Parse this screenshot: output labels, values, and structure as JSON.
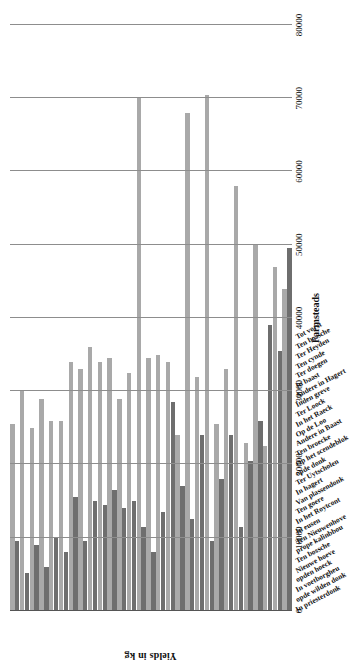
{
  "chart_data": {
    "type": "bar",
    "title": "",
    "xlabel": "Farmsteads",
    "ylabel": "Yields in kg",
    "orientation": "vertical-bars-rotated-page",
    "grid": true,
    "legend": "none",
    "ylim": [
      0,
      80000
    ],
    "yticks": [
      0,
      10000,
      20000,
      30000,
      40000,
      50000,
      60000,
      70000,
      80000
    ],
    "categories": [
      "In priesterdonk",
      "opde wilden donk",
      "In voetborgheu",
      "opden hoeck",
      "Nieuwe hoeve",
      "Ten bossche",
      "prope kalinbbou",
      "Ten Nieuwenhove",
      "In eusen",
      "In het Roytcont",
      "Ten goere",
      "Van plassendonk",
      "In hagert",
      "Ter Uytscholen",
      "opde donk",
      "Op het scendeblok",
      "Ten broecke",
      "Andere in Baast",
      "Op de Loo",
      "In het Raeck",
      "Ter Loock",
      "Inden greve",
      "Andere in Hagert",
      "In baast",
      "Ter doegen",
      "Ten cynde",
      "Ter Heyden",
      "Ten bossche",
      "Tot vorst"
    ],
    "series": [
      {
        "name": "Series 1",
        "color": "#a9a9a9",
        "values": [
          25500,
          30000,
          25000,
          29000,
          26000,
          26000,
          34000,
          33000,
          36000,
          34000,
          34500,
          29000,
          32500,
          70000,
          34500,
          35000,
          34000,
          24000,
          68000,
          32000,
          70500,
          25500,
          33000,
          58000,
          23000,
          50000,
          22500,
          47000,
          44000
        ]
      },
      {
        "name": "Series 2",
        "color": "#6e6e6e",
        "values": [
          9500,
          5200,
          9000,
          6000,
          10000,
          8000,
          15500,
          9500,
          15000,
          14500,
          16500,
          14000,
          15000,
          11500,
          8000,
          13500,
          28500,
          17000,
          12500,
          24000,
          9500,
          18000,
          24000,
          11500,
          20500,
          26000,
          39000,
          35500,
          49500
        ]
      }
    ]
  }
}
